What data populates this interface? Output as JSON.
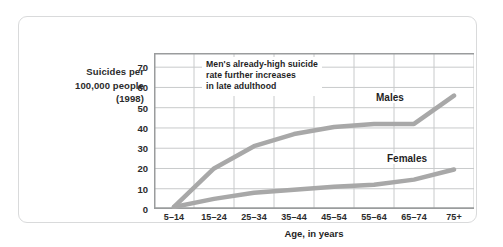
{
  "axis": {
    "ylabel_lines": [
      "Suicides per",
      "100,000 people",
      "(1998)"
    ],
    "xlabel": "Age, in years"
  },
  "annotation": {
    "lines": [
      "Men's already-high suicide",
      "rate further increases",
      "in late adulthood"
    ]
  },
  "colors": {
    "line": "#a8a8a8",
    "grid": "#c8cacb",
    "axis": "#9a9c9d",
    "border": "#d9dadb",
    "text": "#1f1f1f",
    "background": "#ffffff"
  },
  "chart_data": {
    "type": "line",
    "title": "",
    "xlabel": "Age, in years",
    "ylabel": "Suicides per 100,000 people (1998)",
    "categories": [
      "5–14",
      "15–24",
      "25–34",
      "35–44",
      "45–54",
      "55–64",
      "65–74",
      "75+"
    ],
    "ytick_labels": [
      "0",
      "10",
      "20",
      "30",
      "40",
      "50",
      "60",
      "70"
    ],
    "ytick_values": [
      0,
      10,
      20,
      30,
      40,
      50,
      60,
      70
    ],
    "ylim": [
      0,
      77
    ],
    "grid": true,
    "legend": "inline-labels",
    "series": [
      {
        "name": "Males",
        "values": [
          1,
          20,
          31,
          37,
          40.5,
          42,
          42,
          56
        ],
        "color": "#a8a8a8"
      },
      {
        "name": "Females",
        "values": [
          1,
          5,
          8,
          9.5,
          11,
          12,
          14.5,
          19.5
        ],
        "color": "#a8a8a8"
      }
    ],
    "annotations": [
      {
        "text": "Men's already-high suicide rate further increases in late adulthood"
      }
    ]
  }
}
